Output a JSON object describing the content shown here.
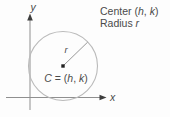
{
  "figure": {
    "type": "circle-diagram",
    "axes": {
      "x_label": "x",
      "y_label": "y"
    },
    "circle": {
      "radius_label": "r",
      "center_label": {
        "c": "C",
        "eq": " = (",
        "h": "h",
        "comma": ", ",
        "k": "k",
        "close": ")"
      }
    },
    "caption": {
      "center_prefix": "Center (",
      "center_h": "h",
      "center_comma": ", ",
      "center_k": "k",
      "center_close": ")",
      "radius_prefix": "Radius ",
      "radius_var": "r"
    },
    "colors": {
      "background": "#fdfdfd",
      "axis_line": "#8f8f8f",
      "arrowhead": "#3d3d3d",
      "circle_stroke": "#bababa",
      "radius_line": "#8c8c8c",
      "center_dot": "#212121",
      "text": "#4a4a4a"
    }
  }
}
